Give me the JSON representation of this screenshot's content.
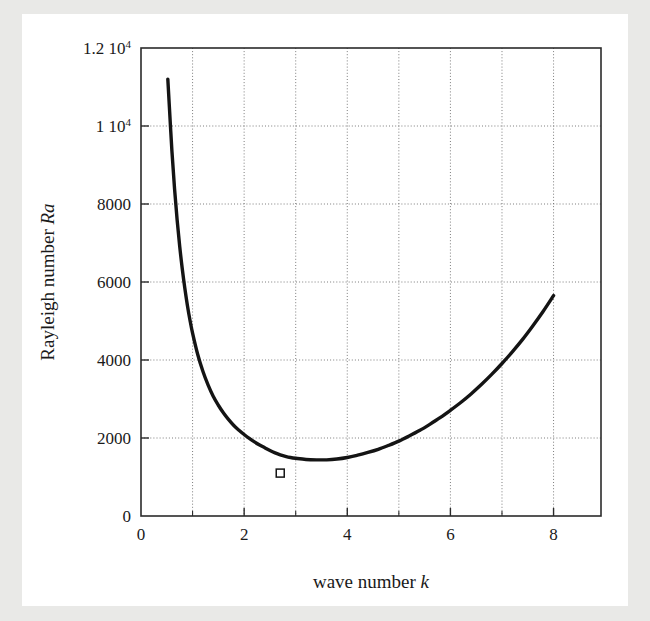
{
  "figure": {
    "background_color": "#ffffff",
    "page_background_color": "#e9e9e7",
    "frame_color": "#2b2b2b",
    "grid_color": "#6e6e6e",
    "curve_color": "#141414"
  },
  "chart_data": {
    "type": "line",
    "title": "",
    "xlabel": "wave number k",
    "xlabel_parts": {
      "text": "wave number ",
      "symbol": "k"
    },
    "ylabel": "Rayleigh number Ra",
    "ylabel_parts": {
      "text": "Rayleigh number ",
      "symbol": "Ra"
    },
    "xlim": [
      0,
      8.92
    ],
    "ylim": [
      0,
      12000
    ],
    "grid": true,
    "grid_style": "dotted",
    "legend": "none",
    "x_major_ticks": [
      0,
      2,
      4,
      6,
      8
    ],
    "x_major_tick_labels": [
      "0",
      "2",
      "4",
      "6",
      "8"
    ],
    "x_minor_ticks": [
      1,
      3,
      5,
      7
    ],
    "x_gridlines": [
      1,
      2,
      3,
      4,
      5,
      6,
      7,
      8
    ],
    "y_major_ticks": [
      0,
      2000,
      4000,
      6000,
      8000,
      10000,
      12000
    ],
    "y_major_tick_labels": [
      "0",
      "2000",
      "4000",
      "6000",
      "8000",
      "1 10^4",
      "1.2 10^4"
    ],
    "y_tick_label_parts": [
      {
        "mantissa": "0",
        "exponent": ""
      },
      {
        "mantissa": "2000",
        "exponent": ""
      },
      {
        "mantissa": "4000",
        "exponent": ""
      },
      {
        "mantissa": "6000",
        "exponent": ""
      },
      {
        "mantissa": "8000",
        "exponent": ""
      },
      {
        "mantissa": "1 10",
        "exponent": "4"
      },
      {
        "mantissa": "1.2 10",
        "exponent": "4"
      }
    ],
    "y_gridlines": [
      2000,
      4000,
      6000,
      8000,
      10000
    ],
    "series": [
      {
        "name": "neutral stability curve",
        "style": "solid",
        "x": [
          0.52,
          0.55,
          0.6,
          0.65,
          0.7,
          0.75,
          0.8,
          0.85,
          0.9,
          0.95,
          1.0,
          1.1,
          1.2,
          1.3,
          1.4,
          1.5,
          1.6,
          1.7,
          1.8,
          1.9,
          2.0,
          2.1,
          2.2,
          2.3,
          2.4,
          2.5,
          2.6,
          2.7,
          2.8,
          2.9,
          3.0,
          3.2,
          3.4,
          3.6,
          3.8,
          4.0,
          4.2,
          4.4,
          4.6,
          4.8,
          5.0,
          5.2,
          5.4,
          5.6,
          5.8,
          6.0,
          6.2,
          6.4,
          6.6,
          6.8,
          7.0,
          7.2,
          7.4,
          7.6,
          7.8,
          8.0
        ],
        "y": [
          11200,
          10500,
          9350,
          8400,
          7600,
          6920,
          6340,
          5840,
          5400,
          5020,
          4690,
          4140,
          3710,
          3360,
          3070,
          2840,
          2640,
          2470,
          2320,
          2200,
          2090,
          1990,
          1900,
          1820,
          1750,
          1680,
          1620,
          1570,
          1530,
          1500,
          1480,
          1450,
          1440,
          1440,
          1460,
          1500,
          1560,
          1630,
          1710,
          1810,
          1920,
          2050,
          2190,
          2350,
          2520,
          2710,
          2910,
          3130,
          3370,
          3630,
          3910,
          4210,
          4530,
          4880,
          5250,
          5650
        ]
      }
    ],
    "markers": [
      {
        "name": "critical-point-marker",
        "shape": "open-square",
        "x": 2.7,
        "y": 1100
      }
    ],
    "annotations": []
  }
}
